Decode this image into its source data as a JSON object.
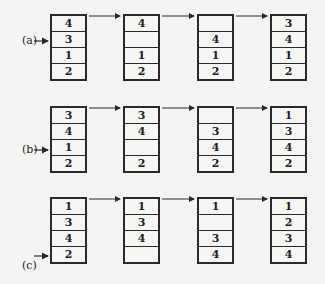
{
  "figure": {
    "rows": [
      {
        "label": "(a)",
        "pointer_slot": 1,
        "stacks": [
          [
            "4",
            "3",
            "1",
            "2"
          ],
          [
            "4",
            "",
            "1",
            "2"
          ],
          [
            "",
            "4",
            "1",
            "2"
          ],
          [
            "3",
            "4",
            "1",
            "2"
          ]
        ]
      },
      {
        "label": "(b)",
        "pointer_slot": 2,
        "stacks": [
          [
            "3",
            "4",
            "1",
            "2"
          ],
          [
            "3",
            "4",
            "",
            "2"
          ],
          [
            "",
            "3",
            "4",
            "2"
          ],
          [
            "1",
            "3",
            "4",
            "2"
          ]
        ]
      },
      {
        "label": "(c)",
        "pointer_slot": 3,
        "stacks": [
          [
            "1",
            "3",
            "4",
            "2"
          ],
          [
            "1",
            "3",
            "4",
            ""
          ],
          [
            "1",
            "",
            "3",
            "4"
          ],
          [
            "1",
            "2",
            "3",
            "4"
          ]
        ]
      }
    ],
    "colors": {
      "line": "#2a2a2a",
      "background": "#f4f4f2"
    }
  }
}
